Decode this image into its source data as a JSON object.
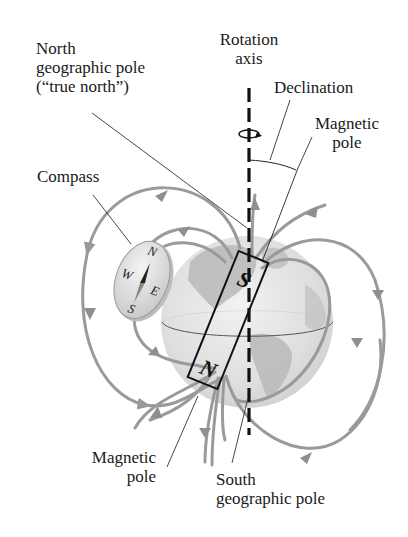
{
  "labels": {
    "rotation_axis": [
      "Rotation",
      "axis"
    ],
    "north_geo_pole": [
      "North",
      "geographic pole",
      "(“true north”)"
    ],
    "declination": "Declination",
    "magnetic_pole_top": [
      "Magnetic",
      "pole"
    ],
    "compass": "Compass",
    "magnetic_pole_bottom": [
      "Magnetic",
      "pole"
    ],
    "south_geo_pole": [
      "South",
      "geographic pole"
    ]
  },
  "magnet": {
    "top_pole": "S",
    "bottom_pole": "N"
  },
  "compass_dial": {
    "n": "N",
    "e": "E",
    "s": "S",
    "w": "W"
  },
  "colors": {
    "field_line": "#9a9a9a",
    "globe_light": "#e6e6e6",
    "globe_dark": "#b5b5b5",
    "ink": "#1a1a1a"
  }
}
